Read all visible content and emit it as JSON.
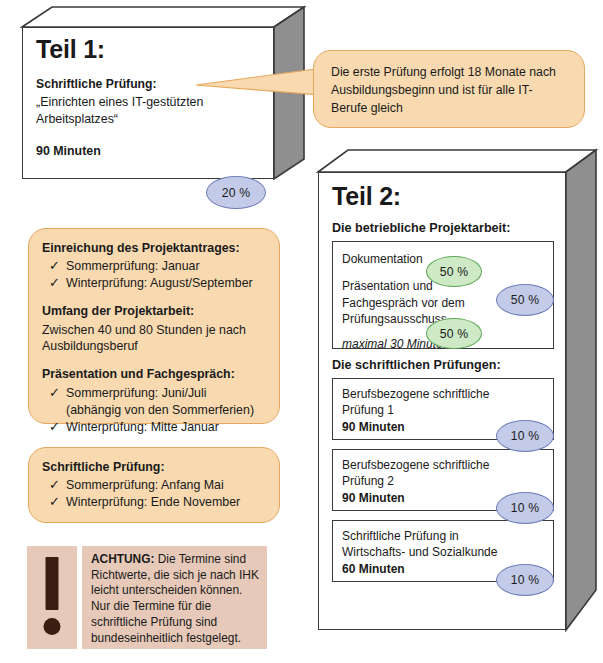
{
  "teil1": {
    "title": "Teil 1:",
    "subtitle": "Schriftliche Prüfung:",
    "topic": "„Einrichten eines IT-gestützten Arbeitsplatzes“",
    "duration": "90 Minuten",
    "weight": "20 %"
  },
  "bubble": {
    "text": "Die erste Prüfung erfolgt 18 Monate nach Ausbildungsbeginn und ist für alle IT-Berufe gleich"
  },
  "dates_box": {
    "groups": [
      {
        "heading": "Einreichung des Projektantrages:",
        "checks": [
          "Sommerprüfung: Januar",
          "Winterprüfung: August/September"
        ],
        "lines": []
      },
      {
        "heading": "Umfang der Projektarbeit:",
        "checks": [],
        "lines": [
          "Zwischen 40 und 80 Stunden je nach",
          "Ausbildungsberuf"
        ]
      },
      {
        "heading": "Präsentation und Fachgespräch:",
        "checks": [
          "Sommerprüfung: Juni/Juli",
          "Winterprüfung: Mitte Januar"
        ],
        "sub_after_first_check": "(abhängig von den Sommerferien)",
        "lines": []
      }
    ]
  },
  "written_box": {
    "heading": "Schriftliche Prüfung:",
    "checks": [
      "Sommerprüfung: Anfang Mai",
      "Winterprüfung: Ende November"
    ]
  },
  "warning": {
    "icon": "exclamation-mark-icon",
    "label": "ACHTUNG:",
    "text": " Die Termine sind Richtwerte, die sich je nach IHK leicht unterscheiden können. Nur die Termine für die schriftliche Prüfung sind bundeseinheitlich festgelegt."
  },
  "teil2": {
    "title": "Teil 2:",
    "project_heading": "Die betriebliche Projektarbeit:",
    "project_card": {
      "line1": "Dokumentation",
      "line2": "Präsentation und",
      "line3": "Fachgespräch vor dem",
      "line4": "Prüfungsausschuss",
      "line5": "maximal 30 Minuten",
      "weight_doc": "50 %",
      "weight_pres": "50 %",
      "weight_total": "50 %"
    },
    "written_heading": "Die schriftlichen Prüfungen:",
    "written_cards": [
      {
        "line1": "Berufsbezogene schriftliche",
        "line2": "Prüfung 1",
        "duration": "90 Minuten",
        "weight": "10 %"
      },
      {
        "line1": "Berufsbezogene schriftliche",
        "line2": "Prüfung 2",
        "duration": "90 Minuten",
        "weight": "10 %"
      },
      {
        "line1": "Schriftliche Prüfung in",
        "line2": "Wirtschafts- und Sozialkunde",
        "duration": "60 Minuten",
        "weight": "10 %"
      }
    ]
  },
  "colors": {
    "callout_fill": "#f8d9b0",
    "callout_border": "#e6a85e",
    "badge_blue_fill": "#c3cbe8",
    "badge_blue_border": "#6f7db8",
    "badge_green_fill": "#cde9c6",
    "badge_green_border": "#5fa854",
    "box_side_gray": "#8f8f8f",
    "warning_fill": "#e6c9b8",
    "ink": "#1a1a1a"
  }
}
